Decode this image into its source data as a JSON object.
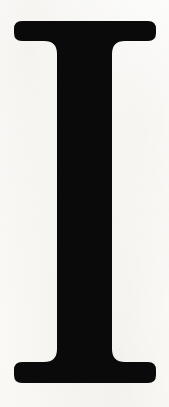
{
  "image": {
    "kind": "scanned-letterform",
    "subject": "capital-letter-I",
    "character": "I",
    "script": "Latin",
    "case": "uppercase",
    "typeface_style": "serif",
    "serif_type": "bracketed slab serif",
    "caption": "I",
    "alt_text": "Large black serif capital letter I on an off-white scanned paper background"
  },
  "colors": {
    "ink": "#0a0a0a",
    "background": "#fdfdfb",
    "paper_tint": "#f2f0ea"
  },
  "geometry": {
    "canvas_width": 169,
    "canvas_height": 407,
    "glyph_top": 21,
    "glyph_bottom": 383,
    "glyph_height": 362,
    "serif_left_x": 14,
    "serif_right_x": 156,
    "serif_width": 142,
    "top_serif_slab_bottom": 41,
    "bottom_serif_slab_top": 362,
    "stem_left_x": 57,
    "stem_right_x": 112,
    "stem_width": 55,
    "stem_center_x": 85
  }
}
